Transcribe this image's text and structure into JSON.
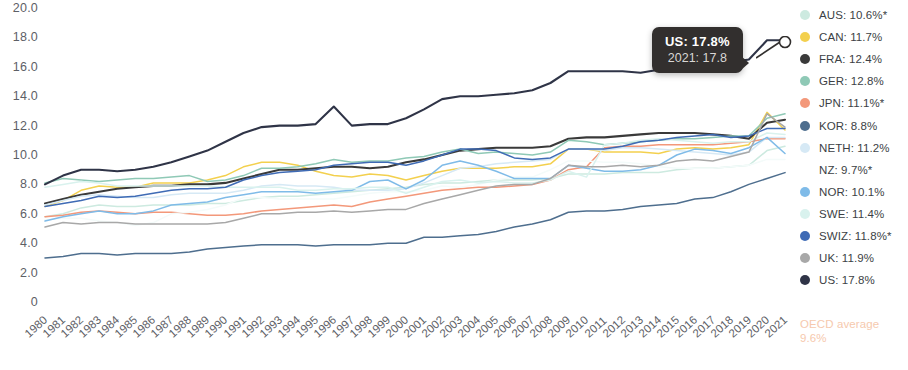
{
  "chart_data": {
    "type": "line",
    "title": "",
    "subtitle": "",
    "xlabel": "",
    "ylabel": "",
    "xlim": [
      1980,
      2021
    ],
    "ylim": [
      0,
      20
    ],
    "y_ticks": [
      "20.0",
      "18.0",
      "16.0",
      "14.0",
      "12.0",
      "10.0",
      "8.0",
      "6.0",
      "4.0",
      "2.0",
      "0"
    ],
    "y_tick_values": [
      20,
      18,
      16,
      14,
      12,
      10,
      8,
      6,
      4,
      2,
      0
    ],
    "grid": false,
    "legend_position": "right",
    "x": [
      1980,
      1981,
      1982,
      1983,
      1984,
      1985,
      1986,
      1987,
      1988,
      1989,
      1990,
      1991,
      1992,
      1993,
      1994,
      1995,
      1996,
      1997,
      1998,
      1999,
      2000,
      2001,
      2002,
      2003,
      2004,
      2005,
      2006,
      2007,
      2008,
      2009,
      2010,
      2011,
      2012,
      2013,
      2014,
      2015,
      2016,
      2017,
      2018,
      2019,
      2020,
      2021
    ],
    "x_tick_labels": [
      "1980",
      "1981",
      "1982",
      "1983",
      "1984",
      "1985",
      "1986",
      "1987",
      "1988",
      "1989",
      "1990",
      "1991",
      "1992",
      "1993",
      "1994",
      "1995",
      "1996",
      "1997",
      "1998",
      "1999",
      "2000",
      "2001",
      "2002",
      "2003",
      "2004",
      "2005",
      "2006",
      "2007",
      "2008",
      "2009",
      "2010",
      "2011",
      "2012",
      "2013",
      "2014",
      "2015",
      "2016",
      "2017",
      "2018",
      "2019",
      "2020",
      "2021"
    ],
    "series": [
      {
        "name": "AUS",
        "color": "#cdeae0",
        "values": [
          5.8,
          6.0,
          6.4,
          6.6,
          6.5,
          6.5,
          6.6,
          6.6,
          6.6,
          6.7,
          6.7,
          6.9,
          7.1,
          7.2,
          7.2,
          7.3,
          7.4,
          7.5,
          7.6,
          7.7,
          7.8,
          8.0,
          8.1,
          8.1,
          8.2,
          8.3,
          8.3,
          8.3,
          8.4,
          8.7,
          8.7,
          8.7,
          8.8,
          8.8,
          8.8,
          9.0,
          9.1,
          9.1,
          9.2,
          9.3,
          10.3,
          10.6
        ]
      },
      {
        "name": "CAN",
        "color": "#f3d04e",
        "values": [
          6.5,
          6.9,
          7.6,
          7.9,
          7.8,
          7.8,
          8.1,
          8.1,
          8.1,
          8.3,
          8.6,
          9.2,
          9.5,
          9.5,
          9.3,
          8.9,
          8.6,
          8.5,
          8.7,
          8.6,
          8.3,
          8.6,
          8.9,
          9.1,
          9.1,
          9.1,
          9.2,
          9.2,
          9.4,
          10.4,
          10.4,
          10.2,
          10.2,
          10.2,
          10.1,
          10.4,
          10.5,
          10.4,
          10.5,
          10.7,
          12.9,
          11.7
        ]
      },
      {
        "name": "FRA",
        "color": "#3a3a3a",
        "values": [
          6.7,
          7.0,
          7.3,
          7.5,
          7.7,
          7.8,
          7.9,
          7.9,
          8.0,
          8.0,
          8.1,
          8.4,
          8.7,
          9.0,
          9.0,
          9.1,
          9.2,
          9.2,
          9.1,
          9.2,
          9.5,
          9.7,
          10.0,
          10.3,
          10.4,
          10.5,
          10.5,
          10.5,
          10.6,
          11.1,
          11.2,
          11.2,
          11.3,
          11.4,
          11.5,
          11.5,
          11.5,
          11.4,
          11.3,
          11.1,
          12.2,
          12.4
        ]
      },
      {
        "name": "GER",
        "color": "#8fc9b6",
        "values": [
          8.1,
          8.4,
          8.3,
          8.2,
          8.3,
          8.4,
          8.4,
          8.5,
          8.6,
          8.2,
          8.3,
          8.6,
          9.1,
          9.1,
          9.2,
          9.4,
          9.7,
          9.5,
          9.6,
          9.6,
          9.8,
          9.9,
          10.2,
          10.4,
          10.1,
          10.2,
          10.1,
          10.0,
          10.2,
          11.0,
          10.9,
          10.7,
          10.8,
          10.9,
          11.0,
          11.1,
          11.1,
          11.2,
          11.3,
          11.3,
          12.5,
          12.8
        ]
      },
      {
        "name": "JPN",
        "color": "#f3987a",
        "values": [
          5.8,
          5.9,
          6.1,
          6.2,
          6.1,
          6.0,
          6.1,
          6.1,
          6.0,
          5.9,
          5.9,
          6.0,
          6.2,
          6.3,
          6.4,
          6.5,
          6.6,
          6.5,
          6.8,
          7.0,
          7.2,
          7.4,
          7.6,
          7.7,
          7.8,
          7.8,
          7.9,
          8.0,
          8.3,
          9.0,
          9.2,
          10.5,
          10.6,
          10.6,
          10.7,
          10.7,
          10.7,
          10.7,
          10.8,
          10.9,
          11.1,
          11.1
        ]
      },
      {
        "name": "KOR",
        "color": "#4e6e8e",
        "values": [
          3.0,
          3.1,
          3.3,
          3.3,
          3.2,
          3.3,
          3.3,
          3.3,
          3.4,
          3.6,
          3.7,
          3.8,
          3.9,
          3.9,
          3.9,
          3.8,
          3.9,
          3.9,
          3.9,
          4.0,
          4.0,
          4.4,
          4.4,
          4.5,
          4.6,
          4.8,
          5.1,
          5.3,
          5.6,
          6.1,
          6.2,
          6.2,
          6.3,
          6.5,
          6.6,
          6.7,
          7.0,
          7.1,
          7.5,
          8.0,
          8.4,
          8.8
        ]
      },
      {
        "name": "NETH",
        "color": "#d6e9f5",
        "values": [
          6.6,
          6.9,
          7.2,
          7.3,
          7.2,
          7.1,
          7.1,
          7.3,
          7.4,
          7.4,
          7.4,
          7.6,
          7.9,
          8.0,
          7.9,
          7.9,
          7.8,
          7.6,
          7.6,
          7.6,
          7.7,
          8.1,
          8.6,
          9.1,
          9.2,
          9.4,
          9.5,
          9.6,
          9.7,
          10.4,
          10.4,
          10.3,
          10.5,
          10.5,
          10.4,
          10.3,
          10.2,
          10.1,
          10.0,
          10.2,
          11.2,
          11.2
        ]
      },
      {
        "name": "NZ",
        "color": "#f4fbfa",
        "values": [
          5.6,
          5.7,
          5.7,
          5.5,
          5.4,
          5.2,
          5.4,
          6.0,
          6.1,
          6.3,
          6.6,
          7.1,
          7.1,
          7.0,
          7.0,
          7.0,
          7.0,
          7.2,
          7.4,
          7.5,
          7.5,
          7.6,
          7.9,
          7.8,
          8.0,
          8.3,
          8.5,
          8.5,
          9.0,
          9.6,
          9.6,
          9.5,
          9.5,
          9.4,
          9.2,
          9.1,
          9.1,
          9.1,
          9.2,
          9.3,
          9.7,
          9.7
        ]
      },
      {
        "name": "NOR",
        "color": "#7fbbe8",
        "values": [
          5.5,
          5.8,
          6.0,
          6.2,
          6.0,
          6.0,
          6.2,
          6.6,
          6.7,
          6.8,
          7.1,
          7.3,
          7.5,
          7.5,
          7.5,
          7.4,
          7.5,
          7.6,
          8.2,
          8.3,
          7.7,
          8.3,
          9.3,
          9.6,
          9.3,
          8.9,
          8.4,
          8.4,
          8.4,
          9.3,
          9.1,
          8.9,
          8.9,
          9.0,
          9.3,
          10.0,
          10.4,
          10.3,
          10.1,
          10.5,
          11.2,
          10.1
        ]
      },
      {
        "name": "SWE",
        "color": "#d9f2ee",
        "values": [
          7.8,
          8.0,
          8.2,
          8.1,
          7.9,
          7.9,
          7.9,
          7.9,
          7.9,
          7.9,
          7.8,
          7.8,
          7.8,
          7.8,
          7.6,
          7.6,
          7.7,
          7.7,
          7.8,
          7.8,
          7.4,
          7.8,
          8.2,
          8.3,
          8.1,
          8.2,
          8.1,
          8.1,
          8.3,
          8.9,
          8.5,
          10.7,
          10.8,
          11.0,
          11.1,
          11.0,
          10.9,
          10.8,
          10.9,
          10.9,
          11.5,
          11.4
        ]
      },
      {
        "name": "SWIZ",
        "color": "#3f6bb5",
        "values": [
          6.5,
          6.7,
          6.9,
          7.2,
          7.1,
          7.2,
          7.4,
          7.6,
          7.7,
          7.7,
          7.8,
          8.3,
          8.6,
          8.8,
          8.9,
          9.0,
          9.3,
          9.4,
          9.5,
          9.5,
          9.3,
          9.6,
          10.0,
          10.4,
          10.4,
          10.3,
          9.8,
          9.7,
          9.8,
          10.4,
          10.4,
          10.4,
          10.6,
          10.9,
          11.0,
          11.2,
          11.3,
          11.4,
          11.2,
          11.3,
          11.8,
          11.8
        ]
      },
      {
        "name": "UK",
        "color": "#a8a8a8",
        "values": [
          5.1,
          5.4,
          5.3,
          5.4,
          5.4,
          5.3,
          5.3,
          5.3,
          5.3,
          5.3,
          5.4,
          5.7,
          6.0,
          6.0,
          6.1,
          6.1,
          6.2,
          6.1,
          6.2,
          6.3,
          6.3,
          6.7,
          7.0,
          7.3,
          7.6,
          7.9,
          8.0,
          8.0,
          8.4,
          9.3,
          9.2,
          9.2,
          9.3,
          9.2,
          9.3,
          9.6,
          9.7,
          9.6,
          9.9,
          10.2,
          12.8,
          11.9
        ]
      },
      {
        "name": "US",
        "color": "#2f3447",
        "values": [
          8.0,
          8.6,
          9.0,
          9.0,
          8.9,
          9.0,
          9.2,
          9.5,
          9.9,
          10.3,
          10.9,
          11.5,
          11.9,
          12.0,
          12.0,
          12.1,
          13.3,
          12.0,
          12.1,
          12.1,
          12.5,
          13.1,
          13.8,
          14.0,
          14.0,
          14.1,
          14.2,
          14.4,
          14.9,
          15.7,
          15.7,
          15.7,
          15.7,
          15.6,
          15.8,
          16.1,
          16.4,
          16.3,
          16.3,
          16.5,
          17.8,
          17.8
        ]
      }
    ],
    "annotation": {
      "series": "US",
      "year": 2021,
      "value": 17.8,
      "title": "US: 17.8%",
      "sub": "2021: 17.8"
    },
    "footnote": "OECD average\n9.6%"
  },
  "legend": {
    "items": [
      {
        "label": "AUS: 10.6%*",
        "color": "#cdeae0",
        "name": "aus"
      },
      {
        "label": "CAN: 11.7%",
        "color": "#f3d04e",
        "name": "can"
      },
      {
        "label": "FRA: 12.4%",
        "color": "#3a3a3a",
        "name": "fra"
      },
      {
        "label": "GER: 12.8%",
        "color": "#8fc9b6",
        "name": "ger"
      },
      {
        "label": "JPN: 11.1%*",
        "color": "#f3987a",
        "name": "jpn"
      },
      {
        "label": "KOR: 8.8%",
        "color": "#4e6e8e",
        "name": "kor"
      },
      {
        "label": "NETH: 11.2%",
        "color": "#d6e9f5",
        "name": "neth"
      },
      {
        "label": "NZ: 9.7%*",
        "color": "#ffffff",
        "name": "nz"
      },
      {
        "label": "NOR: 10.1%",
        "color": "#7fbbe8",
        "name": "nor"
      },
      {
        "label": "SWE: 11.4%",
        "color": "#d9f2ee",
        "name": "swe"
      },
      {
        "label": "SWIZ: 11.8%*",
        "color": "#3f6bb5",
        "name": "swiz"
      },
      {
        "label": "UK: 11.9%",
        "color": "#a8a8a8",
        "name": "uk"
      },
      {
        "label": "US: 17.8%",
        "color": "#2f3447",
        "name": "us"
      }
    ],
    "note": "OECD average\n9.6%",
    "note_color": "#f6c9ae"
  },
  "tooltip": {
    "title": "US: 17.8%",
    "sub": "2021: 17.8",
    "background": "#322f2e",
    "text_color": "#ffffff"
  },
  "axis": {
    "tick_color": "#5d6066"
  }
}
